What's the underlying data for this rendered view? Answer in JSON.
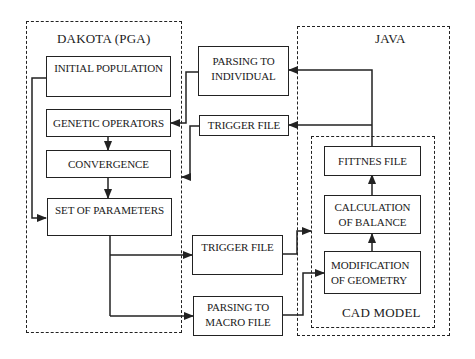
{
  "groups": {
    "dakota": {
      "label": "DAKOTA (PGA)"
    },
    "java": {
      "label": "JAVA"
    },
    "cad": {
      "label": "CAD MODEL"
    }
  },
  "nodes": {
    "initial_population": "INITIAL POPULATION",
    "genetic_operators": "GENETIC OPERATORS",
    "convergence": "CONVERGENCE",
    "set_of_parameters": "SET OF PARAMETERS",
    "parsing_to_individual": "PARSING TO\nINDIVIDUAL",
    "trigger_file_top": "TRIGGER FILE",
    "trigger_file_bottom": "TRIGGER FILE",
    "parsing_to_macro_file": "PARSING TO\nMACRO FILE",
    "fittnes_file": "FITTNES FILE",
    "calculation_of_balance": "CALCULATION\nOF BALANCE",
    "modification_of_geometry": "MODIFICATION\nOF GEOMETRY"
  },
  "edges": [
    {
      "from": "initial_population",
      "to": "set_of_parameters"
    },
    {
      "from": "genetic_operators",
      "to": "convergence"
    },
    {
      "from": "convergence",
      "to": "set_of_parameters"
    },
    {
      "from": "set_of_parameters",
      "to": "trigger_file_bottom"
    },
    {
      "from": "set_of_parameters",
      "to": "parsing_to_macro_file"
    },
    {
      "from": "trigger_file_bottom",
      "to": "cad_model"
    },
    {
      "from": "parsing_to_macro_file",
      "to": "modification_of_geometry"
    },
    {
      "from": "modification_of_geometry",
      "to": "calculation_of_balance"
    },
    {
      "from": "calculation_of_balance",
      "to": "fittnes_file"
    },
    {
      "from": "fittnes_file",
      "to": "parsing_to_individual"
    },
    {
      "from": "fittnes_file",
      "to": "trigger_file_top"
    },
    {
      "from": "parsing_to_individual",
      "to": "genetic_operators"
    },
    {
      "from": "trigger_file_top",
      "to": "dakota_pga"
    }
  ]
}
